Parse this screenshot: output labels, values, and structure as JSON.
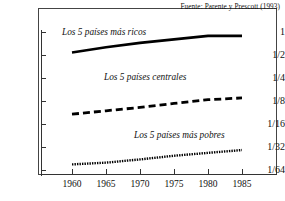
{
  "source_note": "Fuente:  Parente y Prescott (1993)",
  "chart_data": {
    "type": "line",
    "title": "",
    "subtitle": "",
    "xlabel": "",
    "ylabel": "",
    "x": [
      1960,
      1965,
      1970,
      1975,
      1980,
      1985
    ],
    "xlim": [
      1958,
      1987
    ],
    "xticks": [
      1960,
      1965,
      1970,
      1975,
      1980,
      1985
    ],
    "xticklabels": [
      "1960",
      "1965",
      "1970",
      "1975",
      "1980",
      "1985"
    ],
    "yscale": "log2",
    "ylim": [
      0.015625,
      1.0
    ],
    "yticks": [
      1,
      0.5,
      0.25,
      0.125,
      0.0625,
      0.03125,
      0.015625
    ],
    "yticklabels": [
      "1",
      "1/2",
      "1/4",
      "1/8",
      "1/16",
      "1/32",
      "1/64"
    ],
    "grid": false,
    "legend": "inline-annotations",
    "series": [
      {
        "name": "Los 5 países más ricos",
        "style": "solid",
        "color": "#000000",
        "values": [
          0.54,
          0.63,
          0.72,
          0.8,
          0.89,
          0.89
        ]
      },
      {
        "name": "Los 5 países centrales",
        "style": "dashed",
        "color": "#000000",
        "values": [
          0.084,
          0.093,
          0.103,
          0.116,
          0.13,
          0.137
        ]
      },
      {
        "name": "Los 5 países más pobres",
        "style": "dotted",
        "color": "#000000",
        "values": [
          0.0185,
          0.0195,
          0.0215,
          0.024,
          0.0262,
          0.0285
        ]
      }
    ]
  },
  "y_axis": {
    "ticks": [
      {
        "label": "1",
        "top": 27
      },
      {
        "label": "1/2",
        "top": 50
      },
      {
        "label": "1/4",
        "top": 73
      },
      {
        "label": "1/8",
        "top": 96
      },
      {
        "label": "1/16",
        "top": 119
      },
      {
        "label": "1/32",
        "top": 142
      },
      {
        "label": "1/64",
        "top": 165
      }
    ]
  },
  "x_axis": {
    "ticks": [
      {
        "label": "1960",
        "left": 72
      },
      {
        "label": "1965",
        "left": 106
      },
      {
        "label": "1970",
        "left": 140
      },
      {
        "label": "1975",
        "left": 174
      },
      {
        "label": "1980",
        "left": 208
      },
      {
        "label": "1985",
        "left": 242
      }
    ]
  },
  "series_labels": {
    "rich": "Los 5 países más ricos",
    "middle": "Los 5 países centrales",
    "poor": "Los 5 países más pobres"
  }
}
